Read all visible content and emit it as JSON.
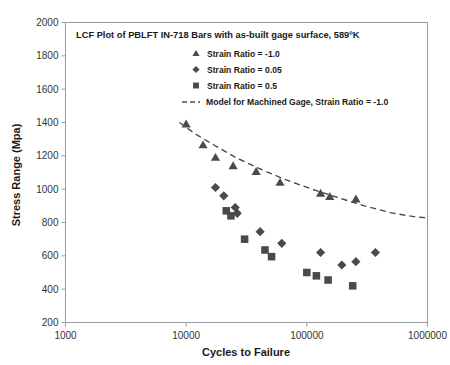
{
  "chart_data": {
    "type": "scatter",
    "title": "LCF Plot of PBLFT IN-718  Bars  with as-built gage surface, 589ºK",
    "xlabel": "Cycles to Failure",
    "ylabel": "Stress Range (Mpa)",
    "xscale": "log",
    "yscale": "linear",
    "xlim": [
      1000,
      1000000
    ],
    "ylim": [
      200,
      2000
    ],
    "xticks": [
      1000,
      10000,
      100000,
      1000000
    ],
    "xticklabels": [
      "1000",
      "10000",
      "100000",
      "1000000"
    ],
    "yticks": [
      200,
      400,
      600,
      800,
      1000,
      1200,
      1400,
      1600,
      1800,
      2000
    ],
    "yticklabels": [
      "200",
      "400",
      "600",
      "800",
      "1000",
      "1200",
      "1400",
      "1600",
      "1800",
      "2000"
    ],
    "grid": false,
    "legend_position": "inside-top-center",
    "series": [
      {
        "name": "Strain Ratio = -1.0",
        "marker": "triangle",
        "color": "#4a4a4a",
        "points": [
          {
            "x": 10000,
            "y": 1390
          },
          {
            "x": 13800,
            "y": 1265
          },
          {
            "x": 17500,
            "y": 1190
          },
          {
            "x": 24500,
            "y": 1140
          },
          {
            "x": 38000,
            "y": 1105
          },
          {
            "x": 60000,
            "y": 1040
          },
          {
            "x": 130000,
            "y": 975
          },
          {
            "x": 155000,
            "y": 955
          },
          {
            "x": 255000,
            "y": 940
          }
        ]
      },
      {
        "name": "Strain Ratio = 0.05",
        "marker": "diamond",
        "color": "#4a4a4a",
        "points": [
          {
            "x": 17500,
            "y": 1010
          },
          {
            "x": 20500,
            "y": 960
          },
          {
            "x": 25500,
            "y": 890
          },
          {
            "x": 26500,
            "y": 855
          },
          {
            "x": 41000,
            "y": 745
          },
          {
            "x": 62000,
            "y": 675
          },
          {
            "x": 130000,
            "y": 620
          },
          {
            "x": 195000,
            "y": 545
          },
          {
            "x": 255000,
            "y": 565
          },
          {
            "x": 370000,
            "y": 620
          }
        ]
      },
      {
        "name": "Strain Ratio = 0.5",
        "marker": "square",
        "color": "#4a4a4a",
        "points": [
          {
            "x": 21500,
            "y": 870
          },
          {
            "x": 23500,
            "y": 840
          },
          {
            "x": 30500,
            "y": 700
          },
          {
            "x": 45000,
            "y": 635
          },
          {
            "x": 51000,
            "y": 595
          },
          {
            "x": 100000,
            "y": 500
          },
          {
            "x": 120000,
            "y": 480
          },
          {
            "x": 150000,
            "y": 455
          },
          {
            "x": 240000,
            "y": 420
          }
        ]
      }
    ],
    "model_line": {
      "name": "Model for Machined Gage, Strain Ratio = -1.0",
      "style": "dashed",
      "color": "#4a4a4a",
      "points": [
        {
          "x": 8800,
          "y": 1400
        },
        {
          "x": 12000,
          "y": 1330
        },
        {
          "x": 17000,
          "y": 1265
        },
        {
          "x": 25000,
          "y": 1195
        },
        {
          "x": 40000,
          "y": 1125
        },
        {
          "x": 65000,
          "y": 1060
        },
        {
          "x": 110000,
          "y": 1000
        },
        {
          "x": 180000,
          "y": 950
        },
        {
          "x": 300000,
          "y": 900
        },
        {
          "x": 500000,
          "y": 858
        },
        {
          "x": 800000,
          "y": 833
        },
        {
          "x": 1000000,
          "y": 828
        }
      ]
    },
    "legend_entries": [
      {
        "label": "Strain Ratio = -1.0",
        "marker": "triangle"
      },
      {
        "label": "Strain Ratio = 0.05",
        "marker": "diamond"
      },
      {
        "label": "Strain Ratio = 0.5",
        "marker": "square"
      },
      {
        "label": "Model for Machined Gage, Strain Ratio = -1.0",
        "marker": "dashed-line"
      }
    ]
  }
}
